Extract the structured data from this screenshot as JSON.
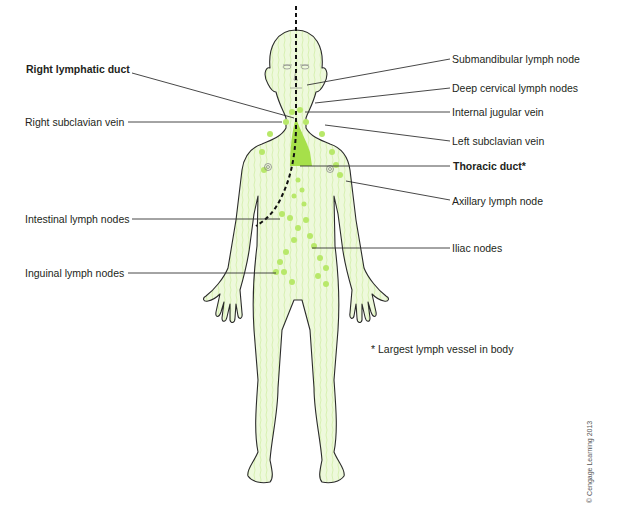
{
  "diagram": {
    "colors": {
      "lymph_fill": "#eaf7d2",
      "lymph_node": "#b8e86a",
      "thoracic_duct": "#a6e04a",
      "outline": "#2b2b2b",
      "leader_line": "#333333"
    },
    "labels_left": [
      {
        "id": "right-lymphatic-duct",
        "text": "Right lymphatic duct",
        "bold": true
      },
      {
        "id": "right-subclavian-vein",
        "text": "Right subclavian vein",
        "bold": false
      },
      {
        "id": "intestinal-lymph-nodes",
        "text": "Intestinal lymph nodes",
        "bold": false
      },
      {
        "id": "inguinal-lymph-nodes",
        "text": "Inguinal lymph nodes",
        "bold": false
      }
    ],
    "labels_right": [
      {
        "id": "submandibular-lymph-node",
        "text": "Submandibular lymph node",
        "bold": false
      },
      {
        "id": "deep-cervical-lymph-nodes",
        "text": "Deep cervical lymph nodes",
        "bold": false
      },
      {
        "id": "internal-jugular-vein",
        "text": "Internal jugular vein",
        "bold": false
      },
      {
        "id": "left-subclavian-vein",
        "text": "Left subclavian vein",
        "bold": false
      },
      {
        "id": "thoracic-duct",
        "text": "Thoracic duct*",
        "bold": true
      },
      {
        "id": "axillary-lymph-node",
        "text": "Axillary lymph node",
        "bold": false
      },
      {
        "id": "iliac-nodes",
        "text": "Iliac nodes",
        "bold": false
      }
    ],
    "footnote": "* Largest lymph vessel in body",
    "copyright": "© Cengage Learning 2013"
  }
}
